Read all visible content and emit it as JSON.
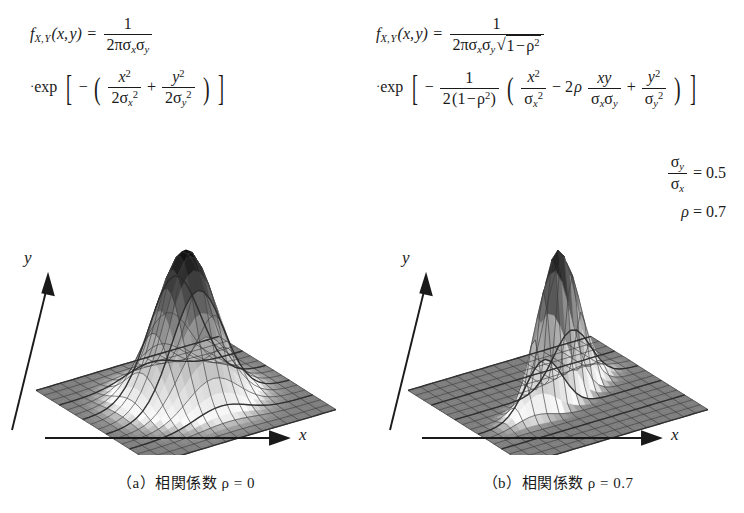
{
  "figure": {
    "background": "#ffffff",
    "ink": "#1a1a1a"
  },
  "panels": [
    {
      "id": "a",
      "caption": "（a）相関係数 ρ = 0",
      "axis_x_label": "x",
      "axis_y_label": "y",
      "formula": {
        "lhs": "f",
        "lhs_sub": "X, Y",
        "args": "(x, y)",
        "eq": "=",
        "frac_num": "1",
        "frac_den": "2πσₓσᵧ",
        "exp_label": "exp",
        "exp_body": "− ( x²/2σₓ² + y²/2σᵧ² )"
      },
      "params": [],
      "surface": {
        "rho": 0.0,
        "sigma_ratio": 1.0
      }
    },
    {
      "id": "b",
      "caption": "（b）相関係数 ρ = 0.7",
      "axis_x_label": "x",
      "axis_y_label": "y",
      "formula": {
        "lhs": "f",
        "lhs_sub": "X, Y",
        "args": "(x, y)",
        "eq": "=",
        "frac_num": "1",
        "frac_den": "2πσₓσᵧ √(1 − ρ²)",
        "exp_label": "exp",
        "exp_body": "− 1/(2(1−ρ²)) ( x²/σₓ² − 2ρ xy/σₓσᵧ + y²/σᵧ² )"
      },
      "params": [
        {
          "lhs_num": "σᵧ",
          "lhs_den": "σₓ",
          "eq": "=",
          "value": "0.5"
        },
        {
          "lhs": "ρ",
          "eq": "=",
          "value": "0.7"
        }
      ],
      "surface": {
        "rho": 0.7,
        "sigma_ratio": 0.5
      }
    }
  ],
  "chart_data": {
    "type": "surface",
    "xlabel": "x",
    "ylabel": "y",
    "zlabel": "f(x,y)",
    "colormap": "grayscale (dark = high, light = mid, gray = base plane)",
    "grid": true,
    "legend": "none",
    "surfaces": [
      {
        "name": "rho = 0",
        "rho": 0.0,
        "sigma_y_over_sigma_x": 1.0,
        "xlim": [
          -3.0,
          3.0
        ],
        "ylim": [
          -3.0,
          3.0
        ],
        "zlim": [
          0.0,
          1.0
        ],
        "peak_value": 1.0,
        "peak_at": [
          0.0,
          0.0
        ],
        "mesh_lines_x": 26,
        "mesh_lines_y": 26
      },
      {
        "name": "rho = 0.7",
        "rho": 0.7,
        "sigma_y_over_sigma_x": 0.5,
        "xlim": [
          -3.0,
          3.0
        ],
        "ylim": [
          -3.0,
          3.0
        ],
        "zlim": [
          0.0,
          1.0
        ],
        "peak_value": 1.0,
        "peak_at": [
          0.0,
          0.0
        ],
        "mesh_lines_x": 26,
        "mesh_lines_y": 26
      }
    ]
  }
}
